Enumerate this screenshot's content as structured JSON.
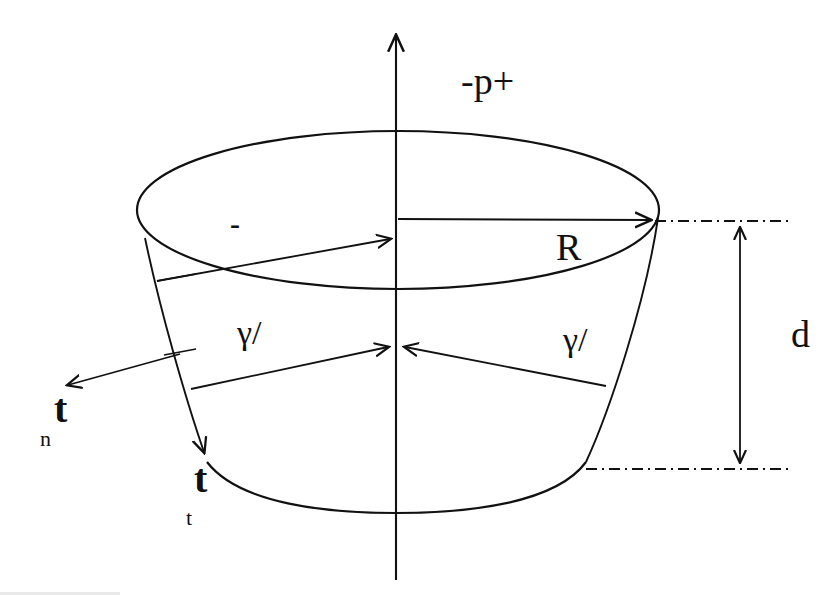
{
  "figure": {
    "background_color": "#ffffff",
    "stroke_color": "#111111"
  },
  "labels": {
    "pressure": "-p+",
    "radius": "R",
    "depth": "d",
    "minus_sign": "-",
    "gamma_left": "γ/",
    "gamma_right": "γ/",
    "normal_vector_base": "t",
    "normal_vector_subscript": "n",
    "tangential_vector_base": "t",
    "tangential_vector_subscript": "t"
  },
  "geometry": {
    "axis_x": 396,
    "axis_top_y": 33,
    "axis_bottom_y": 580,
    "top_ellipse": {
      "cx": 398,
      "cy": 210,
      "rx": 261,
      "ry": 79
    },
    "bottom_arc": {
      "left_x": 207,
      "right_x": 585,
      "bottom_y": 505,
      "y_at_ends": 462
    },
    "dashdot_top": {
      "x1": 655,
      "x2": 788,
      "y": 221
    },
    "dashdot_bottom": {
      "x1": 586,
      "x2": 792,
      "y": 469
    },
    "dimension_arrow": {
      "x": 740,
      "y_top": 224,
      "y_bottom": 466
    },
    "radius_arrow": {
      "x1": 398,
      "y1": 219,
      "x2": 654,
      "y2": 220
    },
    "inner_top_arrow": {
      "x1": 157,
      "y1": 281,
      "x2": 394,
      "y2": 238
    },
    "gamma_arrow_left": {
      "x1": 191,
      "y1": 389,
      "x2": 392,
      "y2": 346
    },
    "gamma_arrow_right": {
      "x1": 606,
      "y1": 386,
      "x2": 401,
      "y2": 346
    },
    "normal_arrow": {
      "x1": 180,
      "y1": 354,
      "x2": 64,
      "y2": 386
    },
    "left_slant_arrow": {
      "x1": 145,
      "y1": 238,
      "x2": 206,
      "y2": 458
    },
    "right_slant": {
      "x1": 658,
      "y1": 218,
      "x2": 585,
      "y2": 463
    }
  },
  "label_positions": {
    "pressure": {
      "left": 461,
      "top": 62
    },
    "radius": {
      "left": 556,
      "top": 228
    },
    "depth": {
      "left": 791,
      "top": 315
    },
    "minus_sign": {
      "left": 230,
      "top": 209
    },
    "gamma_left": {
      "left": 237,
      "top": 316
    },
    "gamma_right": {
      "left": 563,
      "top": 323
    },
    "normal_vector": {
      "left": 40,
      "top": 385
    },
    "tangential_vector": {
      "left": 186,
      "top": 455
    }
  }
}
